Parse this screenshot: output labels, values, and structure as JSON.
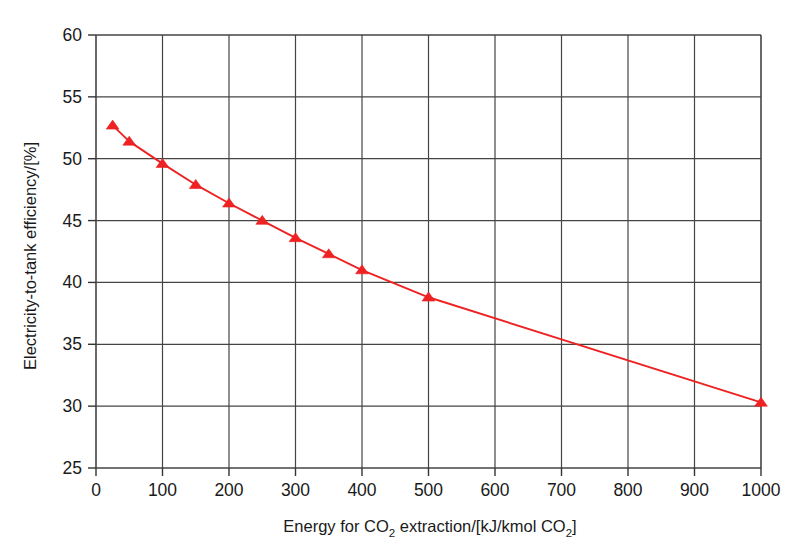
{
  "chart_data": {
    "type": "line",
    "title": "",
    "subtitle": "",
    "xlabel_parts": [
      "Energy for CO",
      "2",
      " extraction/[kJ/kmol CO",
      "2",
      "]"
    ],
    "xlabel": "Energy for CO2 extraction/[kJ/kmol CO2]",
    "ylabel": "Electricity-to-tank efficiency/[%]",
    "x": [
      25,
      50,
      100,
      150,
      200,
      250,
      300,
      350,
      400,
      500,
      1000
    ],
    "y": [
      52.7,
      51.4,
      49.6,
      47.9,
      46.4,
      45.0,
      43.6,
      42.3,
      41.0,
      38.8,
      30.3
    ],
    "series": [
      {
        "name": "Electricity-to-tank efficiency",
        "marker": "triangle-up",
        "color": "#ee2222",
        "line_color": "#ee2222",
        "x": [
          25,
          50,
          100,
          150,
          200,
          250,
          300,
          350,
          400,
          500,
          1000
        ],
        "values": [
          52.7,
          51.4,
          49.6,
          47.9,
          46.4,
          45.0,
          43.6,
          42.3,
          41.0,
          38.8,
          30.3
        ]
      }
    ],
    "xlim": [
      0,
      1000
    ],
    "ylim": [
      25,
      60
    ],
    "xticks": [
      0,
      100,
      200,
      300,
      400,
      500,
      600,
      700,
      800,
      900,
      1000
    ],
    "yticks": [
      25,
      30,
      35,
      40,
      45,
      50,
      55,
      60
    ],
    "xtick_labels": [
      "0",
      "100",
      "200",
      "300",
      "400",
      "500",
      "600",
      "700",
      "800",
      "900",
      "1000"
    ],
    "ytick_labels": [
      "25",
      "30",
      "35",
      "40",
      "45",
      "50",
      "55",
      "60"
    ],
    "grid": true,
    "grid_color": "#444444",
    "legend": "none",
    "legend_position": "none",
    "annotations": []
  }
}
